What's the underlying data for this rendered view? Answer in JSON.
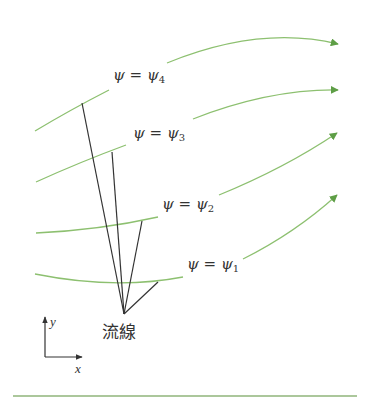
{
  "diagram": {
    "type": "streamlines-with-velocity-vectors",
    "colors": {
      "streamline": "#8dc070",
      "arrowhead": "#5e9e46",
      "vector": "#333333",
      "text": "#333333",
      "bottom_rule": "#8fb57a"
    },
    "streamlines": [
      {
        "id": "psi4",
        "symbol": "ψ",
        "equals": "=",
        "value_symbol": "ψ",
        "subscript": "4"
      },
      {
        "id": "psi3",
        "symbol": "ψ",
        "equals": "=",
        "value_symbol": "ψ",
        "subscript": "3"
      },
      {
        "id": "psi2",
        "symbol": "ψ",
        "equals": "=",
        "value_symbol": "ψ",
        "subscript": "2"
      },
      {
        "id": "psi1",
        "symbol": "ψ",
        "equals": "=",
        "value_symbol": "ψ",
        "subscript": "1"
      }
    ],
    "vectors_caption": "流線",
    "axes": {
      "x_label": "x",
      "y_label": "y"
    }
  }
}
